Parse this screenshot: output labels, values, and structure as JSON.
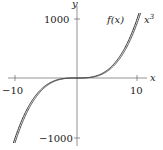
{
  "chart_data": {
    "type": "line",
    "title": "",
    "xlabel": "x",
    "ylabel": "y",
    "xlim": [
      -11,
      12
    ],
    "ylim": [
      -1100,
      1100
    ],
    "grid": false,
    "xticks": [
      {
        "value": -10,
        "label": "−10"
      },
      {
        "value": 10,
        "label": "10"
      }
    ],
    "yticks": [
      {
        "value": 1000,
        "label": "1000"
      },
      {
        "value": -1000,
        "label": "−1000"
      }
    ],
    "series": [
      {
        "name": "f(x)",
        "color": "#333333",
        "x": [
          -10,
          -8,
          -6,
          -4,
          -2,
          0,
          2,
          4,
          6,
          8,
          10
        ],
        "values": [
          -1000,
          -512,
          -216,
          -64,
          -8,
          0,
          8,
          64,
          216,
          512,
          1000
        ]
      },
      {
        "name": "x^3",
        "color": "#555555",
        "x": [
          -10,
          -8,
          -6,
          -4,
          -2,
          0,
          2,
          4,
          6,
          8,
          10
        ],
        "values": [
          -1000,
          -512,
          -216,
          -64,
          -8,
          0,
          8,
          64,
          216,
          512,
          1000
        ]
      }
    ],
    "annotations": [
      {
        "text": "f(x)",
        "near": "upper end of curves"
      },
      {
        "text": "x³",
        "near": "right of f(x) label"
      }
    ]
  },
  "labels": {
    "x_axis": "x",
    "y_axis": "y",
    "xtick_neg": "−10",
    "xtick_pos": "10",
    "ytick_pos": "1000",
    "ytick_neg": "−1000",
    "series_f": "f(x)",
    "series_cube_base": "x",
    "series_cube_exp": "3"
  }
}
